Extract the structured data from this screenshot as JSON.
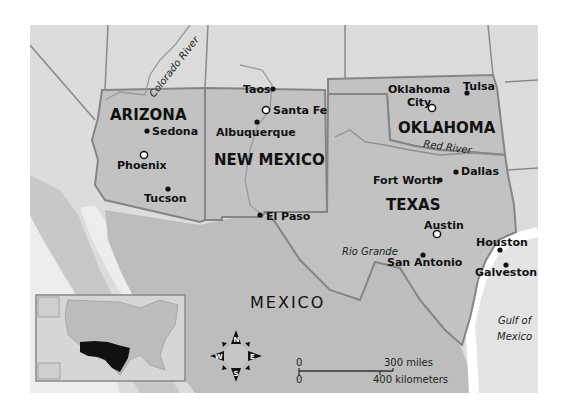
{
  "colors": {
    "background": "#ffffff",
    "land_other": "#dcdcdc",
    "land_region": "#c2c2c2",
    "mexico": "#bdbdbd",
    "water": "#ededed",
    "border": "#858585",
    "highlight": "#111111"
  },
  "states": [
    {
      "id": "arizona",
      "label": "ARIZONA"
    },
    {
      "id": "new-mexico",
      "label": "NEW MEXICO"
    },
    {
      "id": "oklahoma",
      "label": "OKLAHOMA"
    },
    {
      "id": "texas",
      "label": "TEXAS"
    }
  ],
  "country": {
    "label": "MEXICO"
  },
  "cities": [
    {
      "name": "Sedona",
      "capital": false
    },
    {
      "name": "Phoenix",
      "capital": true
    },
    {
      "name": "Tucson",
      "capital": false
    },
    {
      "name": "Taos",
      "capital": false
    },
    {
      "name": "Santa Fe",
      "capital": true
    },
    {
      "name": "Albuquerque",
      "capital": false
    },
    {
      "name": "El Paso",
      "capital": false
    },
    {
      "name": "Oklahoma City",
      "label_line1": "Oklahoma",
      "label_line2": "City",
      "capital": true
    },
    {
      "name": "Tulsa",
      "capital": false
    },
    {
      "name": "Fort Worth",
      "capital": false
    },
    {
      "name": "Dallas",
      "capital": false
    },
    {
      "name": "Austin",
      "capital": true
    },
    {
      "name": "San Antonio",
      "capital": false
    },
    {
      "name": "Houston",
      "capital": false
    },
    {
      "name": "Galveston",
      "capital": false
    }
  ],
  "water_labels": {
    "colorado_river": "Colorado River",
    "red_river": "Red River",
    "rio_grande": "Rio Grande",
    "gulf_line1": "Gulf of",
    "gulf_line2": "Mexico"
  },
  "scale_bar": {
    "zero_top": "0",
    "zero_bottom": "0",
    "miles": "300 miles",
    "kilometers": "400 kilometers"
  },
  "compass": {
    "n": "N",
    "s": "S",
    "e": "E",
    "w": "W"
  },
  "inset": {
    "label": "United States locator",
    "highlighted_states": [
      "Arizona",
      "New Mexico",
      "Oklahoma",
      "Texas"
    ]
  }
}
